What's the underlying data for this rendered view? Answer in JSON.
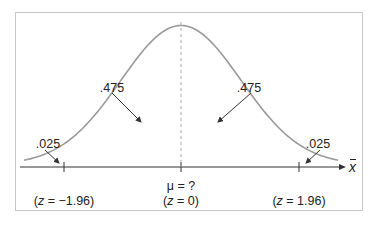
{
  "diagram": {
    "title": "",
    "type": "normal-distribution",
    "axis_label": "x",
    "areas": {
      "left_center": ".475",
      "right_center": ".475",
      "left_tail": ".025",
      "right_tail": ".025"
    },
    "ticks": [
      {
        "id": "left",
        "line2_prefix": "z",
        "line2": " = −1.96"
      },
      {
        "id": "center",
        "line1": "μ = ?",
        "line2_prefix": "z",
        "line2": " = 0"
      },
      {
        "id": "right",
        "line2_prefix": "z",
        "line2": " = 1.96"
      }
    ],
    "colors": {
      "curve": "#9a9a9a",
      "axis": "#333333",
      "frame": "#c8c8c8",
      "text": "#222222"
    }
  }
}
